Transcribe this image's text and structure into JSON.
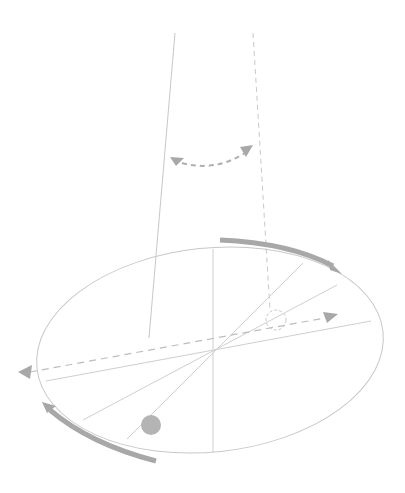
{
  "diagram": {
    "title": "Pendulum swing plane rotating over circular platform",
    "colors": {
      "background": "#ffffff",
      "line": "#c8c8c8",
      "dashed": "#c0c0c0",
      "arrow": "#a8a8a8",
      "bob": "#b4b4b4"
    },
    "elements": [
      "pendulum-string-solid",
      "pendulum-string-dashed",
      "swing-arc-arrow",
      "platform-ellipse",
      "rotation-arrow-top",
      "rotation-arrow-bottom",
      "pendulum-bob-filled",
      "pendulum-bob-ghost",
      "swing-direction-dashed-line"
    ]
  }
}
